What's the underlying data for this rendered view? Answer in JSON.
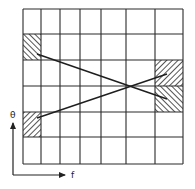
{
  "diagram": {
    "type": "grid-mapping",
    "grid": {
      "columns": 7,
      "rows": 6,
      "x_lines": [
        23,
        41,
        60,
        80,
        101,
        126,
        155,
        183
      ],
      "y_lines": [
        9,
        34,
        60,
        86,
        112,
        137,
        164
      ],
      "line_color": "#2a2a2a"
    },
    "hatched_regions": [
      {
        "name": "source-top-left",
        "col": 0,
        "row": 1,
        "hatch": "forward"
      },
      {
        "name": "source-bottom-left",
        "col": 0,
        "row": 4,
        "hatch": "backward"
      },
      {
        "name": "target-right-upper",
        "col": 6,
        "row": 2,
        "hatch": "backward"
      },
      {
        "name": "target-right-lower",
        "col": 6,
        "row": 3,
        "hatch": "forward"
      }
    ],
    "mapping_lines": [
      {
        "from": [
          37,
          54
        ],
        "to": [
          167,
          99
        ]
      },
      {
        "from": [
          37,
          118
        ],
        "to": [
          167,
          74
        ]
      }
    ],
    "crossing_point": [
      101,
      86
    ],
    "axes": {
      "y_label": "θ",
      "x_label": "f",
      "origin": [
        13,
        175
      ],
      "y_end": [
        13,
        120
      ],
      "x_end": [
        68,
        175
      ]
    }
  }
}
